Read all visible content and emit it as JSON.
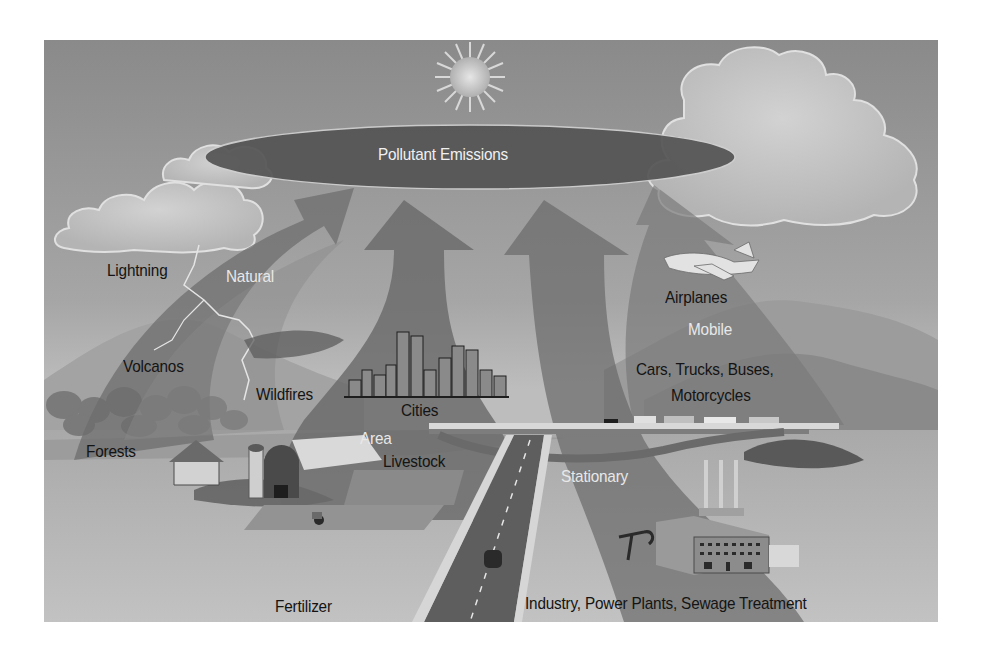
{
  "diagram": {
    "title": "Pollutant Emissions",
    "categories": {
      "natural": "Natural",
      "area": "Area",
      "mobile": "Mobile",
      "stationary": "Stationary"
    },
    "sources": {
      "lightning": "Lightning",
      "volcanos": "Volcanos",
      "wildfires": "Wildfires",
      "forests": "Forests",
      "cities": "Cities",
      "livestock": "Livestock",
      "fertilizer": "Fertilizer",
      "airplanes": "Airplanes",
      "cars_line1": "Cars, Trucks, Buses,",
      "cars_line2": "Motorcycles",
      "industry": "Industry, Power Plants, Sewage Treatment"
    },
    "colors": {
      "sky": "#8e8e8e",
      "ellipse": "#555555",
      "arrow": "#6a6a6a",
      "ground": "#b4b4b4",
      "road": "#5e5e5e"
    }
  }
}
